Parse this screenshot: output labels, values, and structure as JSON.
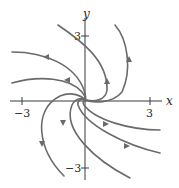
{
  "diagram": {
    "type": "phase-portrait",
    "axes": {
      "x_label": "x",
      "y_label": "y",
      "x_ticks": [
        {
          "value": -3,
          "label": "−3"
        },
        {
          "value": 3,
          "label": "3"
        }
      ],
      "y_ticks": [
        {
          "value": 3,
          "label": "3"
        },
        {
          "value": -3,
          "label": "−3"
        }
      ]
    },
    "colors": {
      "axis": "#3a3a3a",
      "trajectory": "#6a6a6a",
      "background": "#ffffff"
    },
    "trajectory_count": 8,
    "equilibrium": {
      "x": 0,
      "y": 0,
      "kind": "spiral"
    }
  }
}
